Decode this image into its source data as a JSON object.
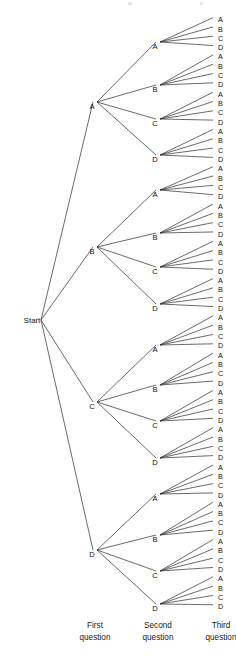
{
  "figure": {
    "type": "tree-diagram",
    "title": "",
    "background_color": "#ffffff",
    "line_color": "#2b2b2b",
    "text_color": "#111111"
  },
  "root": {
    "label": "Start",
    "x": 32,
    "y": 320
  },
  "column_labels": [
    {
      "label_line1": "First",
      "label_line2": "question",
      "x": 95
    },
    {
      "label_line1": "Second",
      "label_line2": "question",
      "x": 158
    },
    {
      "label_line1": "Third",
      "label_line2": "question",
      "x": 221
    }
  ],
  "column_label_y": {
    "line1": 628,
    "line2": 640
  },
  "levels": {
    "level1_x": 95,
    "level2_x": 158,
    "level3_x": 213,
    "leaf_text_x": 218
  },
  "level1_nodes": [
    {
      "label": "A",
      "y": 105
    },
    {
      "label": "B",
      "y": 250
    },
    {
      "label": "C",
      "y": 405
    },
    {
      "label": "D",
      "y": 553
    }
  ],
  "level2_nodes": [
    {
      "label": "A",
      "y": 45,
      "parent": 0
    },
    {
      "label": "B",
      "y": 88,
      "parent": 0
    },
    {
      "label": "C",
      "y": 122,
      "parent": 0
    },
    {
      "label": "D",
      "y": 158,
      "parent": 0
    },
    {
      "label": "A",
      "y": 193,
      "parent": 1
    },
    {
      "label": "B",
      "y": 236,
      "parent": 1
    },
    {
      "label": "C",
      "y": 270,
      "parent": 1
    },
    {
      "label": "D",
      "y": 307,
      "parent": 1
    },
    {
      "label": "A",
      "y": 348,
      "parent": 2
    },
    {
      "label": "B",
      "y": 388,
      "parent": 2
    },
    {
      "label": "C",
      "y": 424,
      "parent": 2
    },
    {
      "label": "D",
      "y": 461,
      "parent": 2
    },
    {
      "label": "A",
      "y": 497,
      "parent": 3
    },
    {
      "label": "B",
      "y": 538,
      "parent": 3
    },
    {
      "label": "C",
      "y": 574,
      "parent": 3
    },
    {
      "label": "D",
      "y": 607,
      "parent": 3
    }
  ],
  "leaf_labels": [
    "A",
    "B",
    "C",
    "D",
    "A",
    "B",
    "C",
    "D",
    "A",
    "B",
    "C",
    "D",
    "A",
    "B",
    "C",
    "D",
    "A",
    "B",
    "C",
    "D",
    "A",
    "B",
    "C",
    "D",
    "A",
    "B",
    "C",
    "D",
    "A",
    "B",
    "C",
    "D",
    "A",
    "B",
    "C",
    "D",
    "A",
    "B",
    "C",
    "D",
    "A",
    "B",
    "C",
    "D",
    "A",
    "B",
    "C",
    "D",
    "A",
    "B",
    "C",
    "D",
    "A",
    "B",
    "C",
    "D",
    "A",
    "B",
    "C",
    "D",
    "A",
    "B",
    "C",
    "D"
  ],
  "leaf_geometry": {
    "first_y": 20,
    "spacing": 9.32,
    "count": 64
  },
  "chart_data": {
    "type": "tree",
    "title": "",
    "branching_factor": 4,
    "depth": 3,
    "total_leaves": 64,
    "choices": [
      "A",
      "B",
      "C",
      "D"
    ],
    "level_names": [
      "First question",
      "Second question",
      "Third question"
    ]
  }
}
